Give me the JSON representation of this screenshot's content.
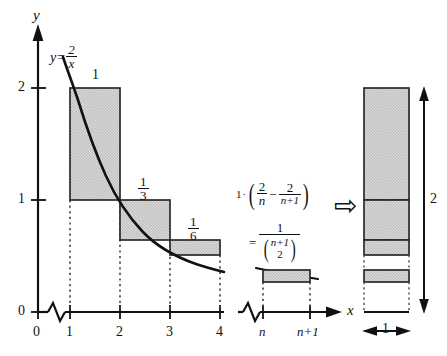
{
  "figure": {
    "kind": "math-diagram",
    "colors": {
      "ink": "#111111",
      "shade": "#d2d2d2",
      "shade_edge": "#2a2a2a",
      "background": "#ffffff"
    }
  },
  "axes": {
    "y_label": "y",
    "x_label": "x",
    "y_ticks": [
      "2",
      "1",
      "0"
    ],
    "x_ticks": [
      "0",
      "1",
      "2",
      "3",
      "4"
    ],
    "x_ticks_right": [
      "n",
      "n+1"
    ],
    "origin_label": "0",
    "break_symbol": "zigzag"
  },
  "curve": {
    "label_y": "y",
    "label_eq": "=",
    "label_num": "2",
    "label_den": "x"
  },
  "bars": [
    {
      "name": "bar-1-to-2",
      "label_num": "1",
      "label_den": "",
      "whole": "1",
      "x0": "1",
      "x1": "2",
      "height": "1"
    },
    {
      "name": "bar-2-to-3",
      "label_num": "1",
      "label_den": "3",
      "whole": "",
      "x0": "2",
      "x1": "3",
      "height": "1/3"
    },
    {
      "name": "bar-3-to-4",
      "label_num": "1",
      "label_den": "6",
      "whole": "",
      "x0": "3",
      "x1": "4",
      "height": "1/6"
    },
    {
      "name": "bar-n-to-n1",
      "label_num": "",
      "label_den": "",
      "whole": "",
      "x0": "n",
      "x1": "n+1",
      "height": "2/n - 2/(n+1)"
    }
  ],
  "formula": {
    "lead": "1",
    "dot": "·",
    "open": "(",
    "t1_num": "2",
    "t1_den": "n",
    "minus": "−",
    "t2_num": "2",
    "t2_den": "n+1",
    "close": ")",
    "equals": "=",
    "result_num": "1",
    "binom_top": "n+1",
    "binom_bottom": "2"
  },
  "arrow": {
    "glyph": "⇨",
    "name": "implies-arrow"
  },
  "column": {
    "width_label": "1",
    "height_label": "2",
    "segments": [
      {
        "name": "col-seg-1",
        "value": "1",
        "shaded": true
      },
      {
        "name": "col-seg-1-3",
        "value": "1/3",
        "shaded": true
      },
      {
        "name": "col-seg-1-6",
        "value": "1/6",
        "shaded": true
      },
      {
        "name": "col-seg-n",
        "value": "2/n - 2/(n+1)",
        "shaded": true
      },
      {
        "name": "col-seg-rest",
        "value": "remainder",
        "shaded": false
      }
    ]
  }
}
